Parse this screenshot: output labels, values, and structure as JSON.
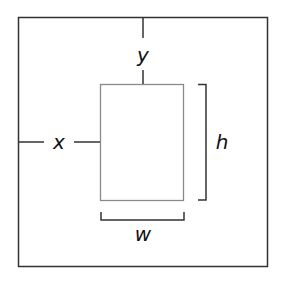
{
  "diagram": {
    "type": "rectangle-position-dimensions",
    "labels": {
      "x": "x",
      "y": "y",
      "w": "w",
      "h": "h"
    },
    "colors": {
      "outer_stroke": "#333333",
      "inner_stroke": "#8a8a8a",
      "annotation_stroke": "#333333",
      "label": "#111111",
      "background": "#ffffff"
    }
  }
}
